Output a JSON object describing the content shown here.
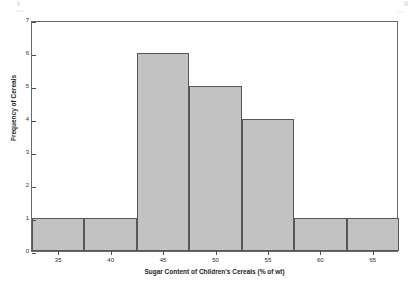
{
  "chart_data": {
    "type": "bar",
    "title": "",
    "subtitle": "",
    "xlabel": "Sugar Content of Children's Cereals (% of wt)",
    "ylabel": "Frequency of Cereals",
    "xlim": [
      32.5,
      67.5
    ],
    "ylim": [
      0,
      7
    ],
    "grid": false,
    "legend": "none",
    "bin_width": 5,
    "categories": [
      "32.5-37.5",
      "37.5-42.5",
      "42.5-47.5",
      "47.5-52.5",
      "52.5-57.5",
      "57.5-62.5",
      "62.5-67.5"
    ],
    "bin_edges": [
      32.5,
      37.5,
      42.5,
      47.5,
      52.5,
      57.5,
      62.5,
      67.5
    ],
    "values": [
      1,
      1,
      6,
      5,
      4,
      1,
      1
    ],
    "bars": [
      {
        "label": "32.5-37.5",
        "x0": 32.5,
        "x1": 37.5,
        "value": 1
      },
      {
        "label": "37.5-42.5",
        "x0": 37.5,
        "x1": 42.5,
        "value": 1
      },
      {
        "label": "42.5-47.5",
        "x0": 42.5,
        "x1": 47.5,
        "value": 6
      },
      {
        "label": "47.5-52.5",
        "x0": 47.5,
        "x1": 52.5,
        "value": 5
      },
      {
        "label": "52.5-57.5",
        "x0": 52.5,
        "x1": 57.5,
        "value": 4
      },
      {
        "label": "57.5-62.5",
        "x0": 57.5,
        "x1": 62.5,
        "value": 1
      },
      {
        "label": "62.5-67.5",
        "x0": 62.5,
        "x1": 67.5,
        "value": 1
      }
    ],
    "xticks": [
      35,
      40,
      45,
      50,
      55,
      60,
      65
    ],
    "xtick_labels": [
      "35",
      "40",
      "45",
      "50",
      "55",
      "60",
      "65"
    ],
    "yticks": [
      0,
      1,
      2,
      3,
      4,
      5,
      6,
      7
    ],
    "ytick_labels": [
      "0",
      "1",
      "2",
      "3",
      "4",
      "5",
      "6",
      "7"
    ],
    "colors": {
      "bar_fill": "#c2c2c2",
      "bar_border": "#575757",
      "axis": "#6a6a6a",
      "text": "#1f1f1f",
      "background": "#ffffff"
    }
  }
}
